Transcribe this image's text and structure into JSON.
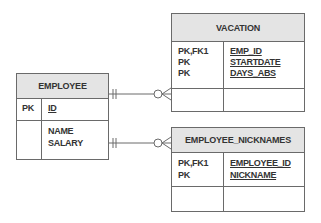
{
  "diagram": {
    "type": "entity-relationship",
    "entities": {
      "employee": {
        "name": "EMPLOYEE",
        "pk_section": {
          "keys": [
            "PK"
          ],
          "attributes": [
            "ID"
          ]
        },
        "attr_section": {
          "attributes": [
            "NAME",
            "SALARY"
          ]
        }
      },
      "vacation": {
        "name": "VACATION",
        "pk_section": {
          "keys": [
            "PK,FK1",
            "PK",
            "PK"
          ],
          "attributes": [
            "EMP_ID",
            "STARTDATE",
            "DAYS_ABS"
          ]
        },
        "attr_section": {
          "attributes": []
        }
      },
      "employee_nicknames": {
        "name": "EMPLOYEE_NICKNAMES",
        "pk_section": {
          "keys": [
            "PK,FK1",
            "PK"
          ],
          "attributes": [
            "EMPLOYEE_ID",
            "NICKNAME"
          ]
        },
        "attr_section": {
          "attributes": []
        }
      }
    },
    "relationships": [
      {
        "from": "EMPLOYEE",
        "to": "VACATION",
        "from_cardinality": "exactly-one",
        "to_cardinality": "zero-or-many"
      },
      {
        "from": "EMPLOYEE",
        "to": "EMPLOYEE_NICKNAMES",
        "from_cardinality": "exactly-one",
        "to_cardinality": "zero-or-many"
      }
    ],
    "colors": {
      "line": "#6a6a6a",
      "header_fill": "#e4e4e4"
    }
  }
}
